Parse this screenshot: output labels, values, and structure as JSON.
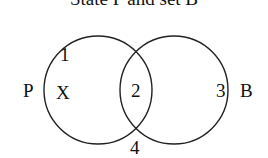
{
  "diagram": {
    "type": "venn",
    "title_clipped": "State P and set B",
    "sets": [
      {
        "name": "P",
        "label": "P"
      },
      {
        "name": "B",
        "label": "B"
      }
    ],
    "regions": {
      "r1": "1",
      "x": "X",
      "r2": "2",
      "r3": "3",
      "r4": "4"
    },
    "colors": {
      "stroke": "#222222",
      "text": "#111111",
      "background": "#ffffff"
    }
  }
}
